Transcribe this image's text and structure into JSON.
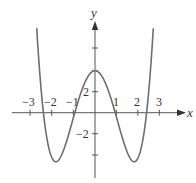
{
  "chart_data": {
    "type": "line",
    "title": "",
    "xlabel": "x",
    "ylabel": "y",
    "xlim": [
      -3.5,
      4
    ],
    "ylim": [
      -6,
      9
    ],
    "grid": false,
    "legend": null,
    "x_ticks": [
      -3,
      -2,
      -1,
      1,
      2,
      3
    ],
    "x_tick_labels": [
      "−3",
      "−2",
      "−1",
      "1",
      "2",
      "3"
    ],
    "y_ticks": [
      -4,
      -2,
      2,
      4,
      6
    ],
    "y_tick_labels": [
      "",
      "−2",
      "2",
      "",
      ""
    ],
    "series": [
      {
        "name": "f(x)",
        "x": [
          -2.8,
          -2.6,
          -2.45,
          -2.2,
          -2.0,
          -1.88,
          -1.7,
          -1.5,
          -1.2,
          -0.94,
          -0.6,
          -0.3,
          0,
          0.3,
          0.6,
          0.94,
          1.2,
          1.5,
          1.7,
          1.88,
          2.0,
          2.2,
          2.45,
          2.6,
          2.8
        ],
        "y": [
          8.1,
          4.3,
          0,
          -3.0,
          -4.3,
          -4.9,
          -4.7,
          -3.6,
          -1.4,
          0,
          2.3,
          3.5,
          4.0,
          3.5,
          2.3,
          0,
          -1.4,
          -3.6,
          -4.7,
          -4.9,
          -4.3,
          -3.0,
          0,
          4.3,
          8.1
        ]
      }
    ],
    "roots_approx": [
      -2.4,
      -0.94,
      0.94,
      2.4
    ],
    "local_max": {
      "x": 0,
      "y": 4
    },
    "local_min": [
      {
        "x": -1.88,
        "y": -4.9
      },
      {
        "x": 1.88,
        "y": -4.9
      }
    ]
  },
  "labels": {
    "x_axis": "x",
    "y_axis": "y",
    "xt": [
      "−3",
      "−2",
      "−1",
      "1",
      "2",
      "3"
    ],
    "yt": [
      "2",
      "−2"
    ]
  }
}
